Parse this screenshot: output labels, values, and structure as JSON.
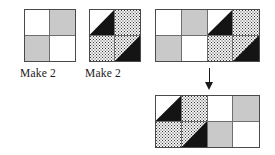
{
  "diagram": {
    "colors": {
      "white": "#ffffff",
      "gray": "#c9c9c9",
      "black": "#141414",
      "dot": "#f2f2f2",
      "outline": "#4a4a4a",
      "seam": "#6e6e6e",
      "arrow": "#1a1a1a"
    }
  },
  "units": [
    {
      "id": "four-patch-unit",
      "label": "Make 2",
      "type": "four-patch",
      "cells": [
        {
          "position": "top-left",
          "fabric": "white"
        },
        {
          "position": "top-right",
          "fabric": "gray"
        },
        {
          "position": "bottom-left",
          "fabric": "gray"
        },
        {
          "position": "bottom-right",
          "fabric": "white"
        }
      ]
    },
    {
      "id": "pinwheel-unit",
      "label": "Make 2",
      "type": "half-square-triangle",
      "cells": [
        {
          "position": "top-left",
          "fabric": "white",
          "triangle_fabric": "black",
          "triangle": "lower-right"
        },
        {
          "position": "top-right",
          "fabric": "dot",
          "triangle_fabric": "none",
          "triangle": "none"
        },
        {
          "position": "bottom-left",
          "fabric": "dot",
          "triangle_fabric": "none",
          "triangle": "none"
        },
        {
          "position": "bottom-right",
          "fabric": "dot",
          "triangle_fabric": "black",
          "triangle": "lower-right"
        }
      ]
    }
  ],
  "rows": [
    {
      "id": "row-top",
      "cells": [
        {
          "fabric": "white",
          "triangle_fabric": "none",
          "triangle": "none"
        },
        {
          "fabric": "gray",
          "triangle_fabric": "none",
          "triangle": "none"
        },
        {
          "fabric": "white",
          "triangle_fabric": "black",
          "triangle": "lower-right"
        },
        {
          "fabric": "dot",
          "triangle_fabric": "none",
          "triangle": "none"
        },
        {
          "fabric": "gray",
          "triangle_fabric": "none",
          "triangle": "none"
        },
        {
          "fabric": "white",
          "triangle_fabric": "none",
          "triangle": "none"
        },
        {
          "fabric": "dot",
          "triangle_fabric": "none",
          "triangle": "none"
        },
        {
          "fabric": "dot",
          "triangle_fabric": "black",
          "triangle": "lower-right"
        }
      ]
    },
    {
      "id": "row-bottom",
      "cells": [
        {
          "fabric": "white",
          "triangle_fabric": "black",
          "triangle": "lower-right"
        },
        {
          "fabric": "dot",
          "triangle_fabric": "none",
          "triangle": "none"
        },
        {
          "fabric": "white",
          "triangle_fabric": "none",
          "triangle": "none"
        },
        {
          "fabric": "gray",
          "triangle_fabric": "none",
          "triangle": "none"
        },
        {
          "fabric": "dot",
          "triangle_fabric": "none",
          "triangle": "none"
        },
        {
          "fabric": "dot",
          "triangle_fabric": "black",
          "triangle": "lower-right"
        },
        {
          "fabric": "gray",
          "triangle_fabric": "none",
          "triangle": "none"
        },
        {
          "fabric": "white",
          "triangle_fabric": "none",
          "triangle": "none"
        }
      ]
    }
  ],
  "arrow": {
    "direction": "down",
    "glyph": "arrow-down"
  }
}
